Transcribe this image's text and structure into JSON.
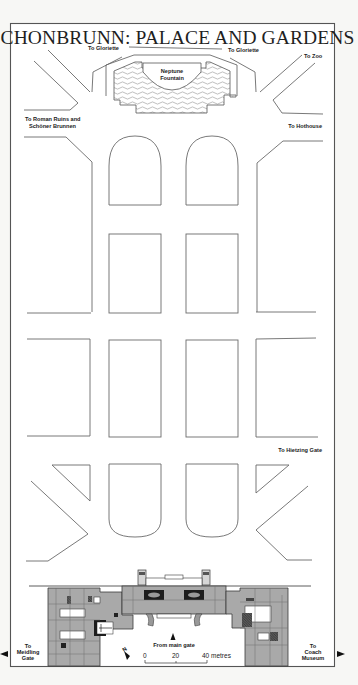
{
  "map": {
    "title": "SCHONBRUNN: PALACE AND GARDENS",
    "labels": {
      "to_gloriette_left": "To Gloriette",
      "to_gloriette_right": "To Gloriette",
      "to_zoo": "To Zoo",
      "neptune_fountain_line1": "Neptune",
      "neptune_fountain_line2": "Fountain",
      "roman_ruins_line1": "To Roman Ruins and",
      "roman_ruins_line2": "Schöner Brunnen",
      "to_hothouse": "To Hothouse",
      "to_hietzing_gate": "To Hietzing Gate",
      "from_main_gate": "From main gate",
      "meidling_line1": "To",
      "meidling_line2": "Meidling",
      "meidling_line3": "Gate",
      "coach_line1": "To",
      "coach_line2": "Coach",
      "coach_line3": "Museum"
    },
    "scale_bar": {
      "ticks": [
        "0",
        "20",
        "40 metres"
      ]
    },
    "north_arrow": {
      "label": "N"
    },
    "colors": {
      "background": "#ffffff",
      "outline": "#6a6a6a",
      "palace_fill": "#a9a9a9",
      "palace_dark": "#1d1d1d"
    }
  }
}
